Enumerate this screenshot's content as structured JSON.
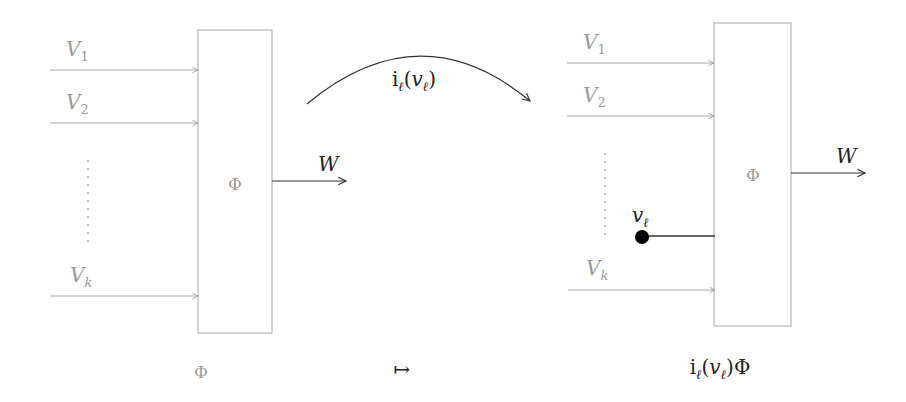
{
  "diagram": {
    "left": {
      "caption": "Φ",
      "box_label": "Φ",
      "inputs": [
        {
          "label": "V",
          "sub": "1"
        },
        {
          "label": "V",
          "sub": "2"
        },
        {
          "label": "V",
          "sub": "k"
        }
      ],
      "ellipsis": "⋮",
      "output": {
        "label": "W"
      }
    },
    "transform": {
      "arc_label_main": "i",
      "arc_label_sub": "ℓ",
      "arc_label_rest_open": "(",
      "arc_label_var": "v",
      "arc_label_var_sub": "ℓ",
      "arc_label_close": ")",
      "maps_to": "↦"
    },
    "right": {
      "caption_main": "i",
      "caption_sub": "ℓ",
      "caption_open": "(",
      "caption_var": "v",
      "caption_var_sub": "ℓ",
      "caption_close": ")Φ",
      "box_label": "Φ",
      "inputs": [
        {
          "label": "V",
          "sub": "1"
        },
        {
          "label": "V",
          "sub": "2"
        },
        {
          "label": "V",
          "sub": "k"
        }
      ],
      "plugged": {
        "label": "v",
        "sub": "ℓ"
      },
      "output": {
        "label": "W"
      }
    },
    "colors": {
      "faded": "#9a9a9a",
      "ink": "#222222",
      "dot": "#000000"
    }
  }
}
